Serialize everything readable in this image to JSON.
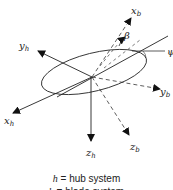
{
  "diagram": {
    "axes": {
      "hub": [
        {
          "id": "x_h",
          "base": "x",
          "sub": "h"
        },
        {
          "id": "y_h",
          "base": "y",
          "sub": "h"
        },
        {
          "id": "z_h",
          "base": "z",
          "sub": "h"
        }
      ],
      "blade": [
        {
          "id": "x_b",
          "base": "x",
          "sub": "b"
        },
        {
          "id": "y_b",
          "base": "y",
          "sub": "b"
        },
        {
          "id": "z_b",
          "base": "z",
          "sub": "b"
        }
      ]
    },
    "angles": {
      "beta": "β",
      "psi": "ψ"
    },
    "legend": [
      {
        "symbol": "h",
        "text": " = hub system"
      },
      {
        "symbol": "b",
        "text": " = blade system"
      }
    ]
  }
}
